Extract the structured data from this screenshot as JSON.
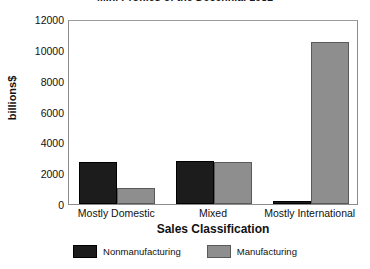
{
  "chart_data": {
    "type": "bar",
    "title": "Mini Profiles of the Decennial 1982",
    "xlabel": "Sales Classification",
    "ylabel": "billions$",
    "categories": [
      "Mostly Domestic",
      "Mixed",
      "Mostly International"
    ],
    "series": [
      {
        "name": "Nonmanufacturing",
        "color": "#1c1c1c",
        "values": [
          2750,
          2800,
          200
        ]
      },
      {
        "name": "Manufacturing",
        "color": "#8e8e8e",
        "values": [
          1050,
          2750,
          10500
        ]
      }
    ],
    "ylim": [
      0,
      12000
    ],
    "yticks": [
      0,
      2000,
      4000,
      6000,
      8000,
      10000,
      12000
    ],
    "ytick_labels": [
      "0",
      "2000",
      "4000",
      "6000",
      "8000",
      "10000",
      "12000"
    ],
    "grid": false,
    "legend_position": "bottom",
    "frame": true
  }
}
